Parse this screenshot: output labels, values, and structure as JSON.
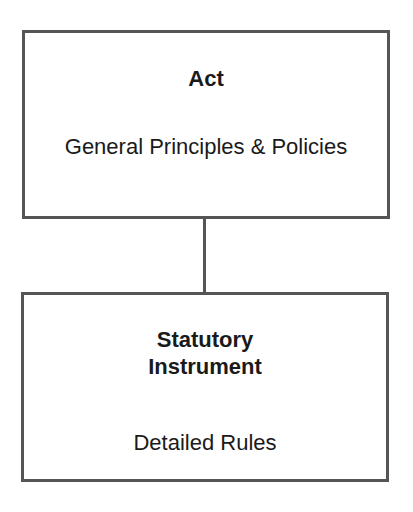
{
  "diagram": {
    "nodes": [
      {
        "id": "act",
        "title": "Act",
        "description": "General Principles & Policies"
      },
      {
        "id": "statutory-instrument",
        "title": "Statutory Instrument",
        "description": "Detailed Rules"
      }
    ],
    "edges": [
      {
        "from": "act",
        "to": "statutory-instrument"
      }
    ],
    "colors": {
      "border": "#555555",
      "text": "#1a1a1a",
      "background": "#ffffff"
    }
  }
}
